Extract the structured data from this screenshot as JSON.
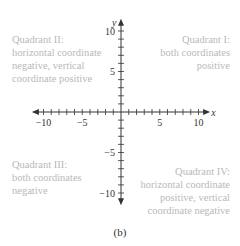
{
  "figure": {
    "caption": "(b)",
    "axes": {
      "x_label": "x",
      "y_label": "y",
      "x_range": [
        -10,
        10
      ],
      "y_range": [
        -10,
        10
      ],
      "tick_step": 1,
      "x_tick_labels": [
        {
          "value": -10,
          "text": "−10"
        },
        {
          "value": -5,
          "text": "−5"
        },
        {
          "value": 5,
          "text": "5"
        },
        {
          "value": 10,
          "text": "10"
        }
      ],
      "y_tick_labels": [
        {
          "value": 10,
          "text": "10"
        },
        {
          "value": 5,
          "text": "5"
        },
        {
          "value": -5,
          "text": "−5"
        },
        {
          "value": -10,
          "text": "−10"
        }
      ]
    },
    "quadrants": {
      "q1": {
        "lines": [
          "Quadrant I:",
          "both coordinates",
          "positive"
        ]
      },
      "q2": {
        "lines": [
          "Quadrant II:",
          "horizontal coordinate",
          "negative, vertical",
          "coordinate positive"
        ]
      },
      "q3": {
        "lines": [
          "Quadrant III:",
          "both coordinates",
          "negative"
        ]
      },
      "q4": {
        "lines": [
          "Quadrant IV:",
          "horizontal coordinate",
          "positive, vertical",
          "coordinate negative"
        ]
      }
    },
    "colors": {
      "axis": "#333333",
      "quadrant_text": "#b9b9b9"
    }
  }
}
